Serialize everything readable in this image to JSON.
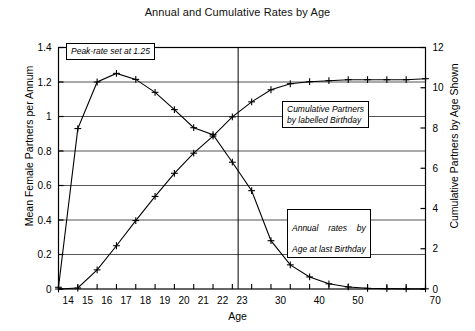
{
  "chart_data": {
    "type": "line",
    "title": "Annual and Cumulative Rates by Age",
    "xlabel": "Age",
    "ylabel": "Mean Female Partners per Annum",
    "ylabel_right": "Cumulative Partners by Age Shown",
    "categories": [
      "14",
      "15",
      "16",
      "17",
      "18",
      "19",
      "20",
      "21",
      "22",
      "23",
      "25",
      "30",
      "35",
      "40",
      "45",
      "50",
      "55",
      "60",
      "65",
      "70"
    ],
    "xtick_labels": [
      "14",
      "15",
      "16",
      "17",
      "18",
      "19",
      "20",
      "21",
      "22",
      "23",
      "30",
      "40",
      "50",
      "70"
    ],
    "ylim": [
      0,
      1.4
    ],
    "ytick_labels": [
      "0",
      "0.2",
      "0.4",
      "0.6",
      "0.8",
      "1",
      "1.2",
      "1.4"
    ],
    "ylim_right": [
      0,
      12
    ],
    "ytick_labels_right": [
      "0",
      "2",
      "4",
      "6",
      "8",
      "10",
      "12"
    ],
    "grid": true,
    "legend": "none",
    "series": [
      {
        "name": "Annual rates by Age at last Birthday",
        "axis": "left",
        "values": [
          0.01,
          0.93,
          1.2,
          1.25,
          1.215,
          1.14,
          1.04,
          0.935,
          0.895,
          0.735,
          0.57,
          0.28,
          0.14,
          0.07,
          0.03,
          0.012,
          0.004,
          0.002,
          0.001,
          0.001
        ]
      },
      {
        "name": "Cumulative Partners by labelled Birthday",
        "axis": "right",
        "values": [
          0.0,
          0.05,
          0.95,
          2.15,
          3.4,
          4.6,
          5.75,
          6.75,
          7.6,
          8.55,
          9.3,
          9.9,
          10.2,
          10.3,
          10.35,
          10.4,
          10.4,
          10.4,
          10.4,
          10.45
        ]
      }
    ],
    "annotations": [
      {
        "id": "peak",
        "text": "Peak-rate set at 1.25"
      },
      {
        "id": "cumulative",
        "text": "Cumulative Partners\nby labelled Birthday"
      },
      {
        "id": "annual",
        "line1": "Annual  rates  by",
        "line2": "Age at last Birthday"
      }
    ],
    "vertical_divider_at": "23.3"
  }
}
